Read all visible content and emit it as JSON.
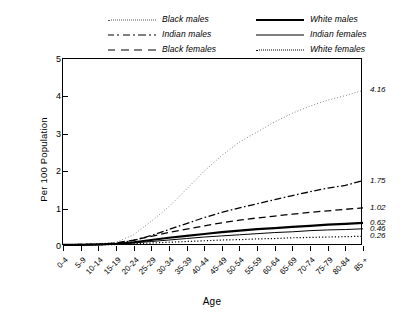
{
  "chart_data": {
    "type": "line",
    "title": "",
    "xlabel": "Age",
    "ylabel": "Per 100 Population",
    "ylim": [
      0,
      5
    ],
    "yticks": [
      0,
      1,
      2,
      3,
      4,
      5
    ],
    "grid": false,
    "legend_position": "top",
    "categories": [
      "0-4",
      "5-9",
      "10-14",
      "15-19",
      "20-24",
      "25-29",
      "30-34",
      "35-39",
      "40-44",
      "45-49",
      "50-54",
      "55-59",
      "60-64",
      "65-69",
      "70-74",
      "75-79",
      "80-84",
      "85 +"
    ],
    "series": [
      {
        "name": "Black males",
        "style": "dotted-fine",
        "end_label": "4.16",
        "values": [
          0.04,
          0.05,
          0.06,
          0.1,
          0.3,
          0.66,
          1.05,
          1.52,
          2.0,
          2.42,
          2.78,
          3.05,
          3.32,
          3.55,
          3.74,
          3.9,
          4.02,
          4.16
        ]
      },
      {
        "name": "Indian males",
        "style": "dashdot",
        "end_label": "1.75",
        "values": [
          0.03,
          0.04,
          0.05,
          0.07,
          0.15,
          0.28,
          0.44,
          0.6,
          0.76,
          0.9,
          1.02,
          1.13,
          1.24,
          1.35,
          1.45,
          1.55,
          1.62,
          1.75
        ]
      },
      {
        "name": "Black females",
        "style": "dashed",
        "end_label": "1.02",
        "values": [
          0.03,
          0.04,
          0.05,
          0.08,
          0.16,
          0.26,
          0.36,
          0.45,
          0.54,
          0.62,
          0.69,
          0.75,
          0.8,
          0.85,
          0.9,
          0.94,
          0.98,
          1.02
        ]
      },
      {
        "name": "White males",
        "style": "solid-thick",
        "end_label": "0.62",
        "values": [
          0.03,
          0.03,
          0.04,
          0.06,
          0.1,
          0.16,
          0.22,
          0.27,
          0.32,
          0.37,
          0.41,
          0.45,
          0.48,
          0.51,
          0.54,
          0.57,
          0.59,
          0.62
        ]
      },
      {
        "name": "Indian females",
        "style": "solid-thin",
        "end_label": "0.46",
        "values": [
          0.02,
          0.03,
          0.03,
          0.05,
          0.08,
          0.12,
          0.16,
          0.2,
          0.24,
          0.27,
          0.3,
          0.33,
          0.36,
          0.38,
          0.41,
          0.43,
          0.44,
          0.46
        ]
      },
      {
        "name": "White females",
        "style": "dotted",
        "end_label": "0.26",
        "values": [
          0.02,
          0.02,
          0.03,
          0.04,
          0.06,
          0.08,
          0.1,
          0.12,
          0.14,
          0.16,
          0.17,
          0.19,
          0.2,
          0.22,
          0.23,
          0.24,
          0.25,
          0.26
        ]
      }
    ]
  },
  "legend": {
    "columns": [
      {
        "items": [
          {
            "label": "Black males",
            "style": "dotted-fine"
          },
          {
            "label": "Indian males",
            "style": "dashdot"
          },
          {
            "label": "Black females",
            "style": "dashed"
          }
        ]
      },
      {
        "items": [
          {
            "label": "White males",
            "style": "solid-thick"
          },
          {
            "label": "Indian females",
            "style": "solid-thin"
          },
          {
            "label": "White females",
            "style": "dotted"
          }
        ]
      }
    ]
  },
  "axes": {
    "x_title": "Age",
    "y_title": "Per 100 Population"
  }
}
